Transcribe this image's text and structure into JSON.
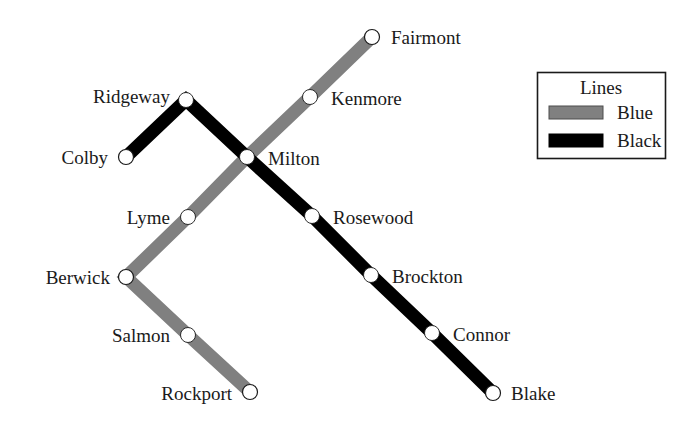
{
  "diagram": {
    "background_color": "#ffffff",
    "line_width": 13,
    "station_radius": 7.5,
    "station_fill": "#ffffff",
    "station_stroke": "#1a1a1a"
  },
  "legend": {
    "title": "Lines",
    "box": {
      "x": 537,
      "y": 72,
      "width": 128,
      "height": 86
    },
    "border_color": "#1a1a1a",
    "entries": [
      {
        "label": "Blue",
        "color": "#808080",
        "swatch_stroke": "#4d4d4d"
      },
      {
        "label": "Black",
        "color": "#000000",
        "swatch_stroke": "#000000"
      }
    ]
  },
  "lines": [
    {
      "name": "Blue",
      "color": "#808080",
      "stations": [
        "Fairmont",
        "Kenmore",
        "Milton",
        "Lyme",
        "Berwick",
        "Salmon",
        "Rockport"
      ],
      "path": "M 372 37 L 310 97 L 247 157 L 188 217 L 126 277 L 188 335 L 250 392"
    },
    {
      "name": "Black",
      "color": "#000000",
      "stations": [
        "Colby",
        "Ridgeway",
        "Milton",
        "Rosewood",
        "Brockton",
        "Connor",
        "Blake"
      ],
      "path": "M 126 157 L 186 100 L 247 157 L 312 216 L 371 275 L 432 333 L 493 393"
    }
  ],
  "stations": [
    {
      "name": "Fairmont",
      "x": 372,
      "y": 37,
      "line": "Blue",
      "terminal": true,
      "label_x": 391,
      "label_y": 44,
      "label_anchor": "start"
    },
    {
      "name": "Kenmore",
      "x": 310,
      "y": 97,
      "line": "Blue",
      "terminal": false,
      "label_x": 331,
      "label_y": 105,
      "label_anchor": "start"
    },
    {
      "name": "Ridgeway",
      "x": 186,
      "y": 100,
      "line": "Black",
      "terminal": false,
      "label_x": 170,
      "label_y": 103,
      "label_anchor": "end"
    },
    {
      "name": "Colby",
      "x": 126,
      "y": 157,
      "line": "Black",
      "terminal": true,
      "label_x": 108,
      "label_y": 164,
      "label_anchor": "end"
    },
    {
      "name": "Milton",
      "x": 247,
      "y": 157,
      "line": "Both",
      "terminal": false,
      "label_x": 268,
      "label_y": 165,
      "label_anchor": "start"
    },
    {
      "name": "Lyme",
      "x": 188,
      "y": 217,
      "line": "Blue",
      "terminal": false,
      "label_x": 170,
      "label_y": 224,
      "label_anchor": "end"
    },
    {
      "name": "Rosewood",
      "x": 312,
      "y": 216,
      "line": "Black",
      "terminal": false,
      "label_x": 333,
      "label_y": 224,
      "label_anchor": "start"
    },
    {
      "name": "Berwick",
      "x": 126,
      "y": 277,
      "line": "Blue",
      "terminal": true,
      "label_x": 110,
      "label_y": 284,
      "label_anchor": "end"
    },
    {
      "name": "Brockton",
      "x": 371,
      "y": 275,
      "line": "Black",
      "terminal": false,
      "label_x": 392,
      "label_y": 283,
      "label_anchor": "start"
    },
    {
      "name": "Salmon",
      "x": 188,
      "y": 335,
      "line": "Blue",
      "terminal": false,
      "label_x": 170,
      "label_y": 342,
      "label_anchor": "end"
    },
    {
      "name": "Connor",
      "x": 432,
      "y": 333,
      "line": "Black",
      "terminal": false,
      "label_x": 453,
      "label_y": 341,
      "label_anchor": "start"
    },
    {
      "name": "Rockport",
      "x": 250,
      "y": 392,
      "line": "Blue",
      "terminal": true,
      "label_x": 232,
      "label_y": 400,
      "label_anchor": "end"
    },
    {
      "name": "Blake",
      "x": 493,
      "y": 393,
      "line": "Black",
      "terminal": true,
      "label_x": 511,
      "label_y": 400,
      "label_anchor": "start"
    }
  ]
}
